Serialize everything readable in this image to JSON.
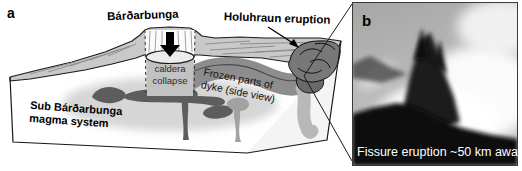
{
  "figure": {
    "panel_a": {
      "label": "a",
      "volcano_label": "Bárðarbunga",
      "eruption_label": "Holuhraun eruption",
      "caldera_label_line1": "caldera",
      "caldera_label_line2": "collapse",
      "dyke_label_line1": "Frozen parts of",
      "dyke_label_line2": "dyke (side view)",
      "magma_label_line1": "Sub Bárðarbunga",
      "magma_label_line2": "magma system"
    },
    "panel_b": {
      "label": "b",
      "caption": "Fissure eruption ~50 km away"
    },
    "colors": {
      "terrain": "#c9c9c9",
      "dyke": "#8d8d8d",
      "dyke_tail": "#b8b8b8",
      "magma_dark": "#5d5d5d",
      "magma_light": "#a2a2a2",
      "magma_halo": "#d6d6d6",
      "outline": "#1a1a1a",
      "caldera_fill": "#c2c2c2",
      "eruption_blob": "#787878",
      "photo_caption": "#ffffff"
    }
  }
}
